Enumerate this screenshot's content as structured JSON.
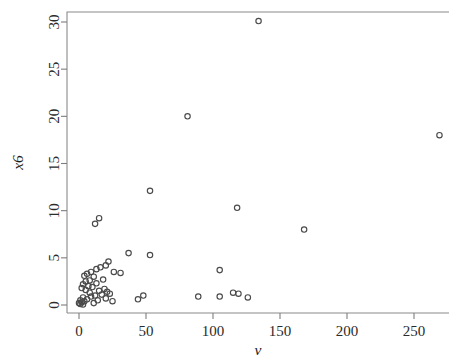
{
  "chart_data": {
    "type": "scatter",
    "title": "",
    "xlabel": "v",
    "ylabel": "x6",
    "xlim": [
      -8,
      278
    ],
    "ylim": [
      -1.2,
      31.5
    ],
    "xticks": [
      0,
      50,
      100,
      150,
      200,
      250
    ],
    "yticks": [
      0,
      5,
      10,
      15,
      20,
      25,
      30
    ],
    "grid": false,
    "legend": null,
    "marker": "open-circle",
    "marker_color": "#4a4a4a",
    "points": [
      {
        "x": 134,
        "y": 30.1
      },
      {
        "x": 81,
        "y": 20.0
      },
      {
        "x": 269,
        "y": 18.0
      },
      {
        "x": 53,
        "y": 12.1
      },
      {
        "x": 118,
        "y": 10.3
      },
      {
        "x": 168,
        "y": 8.0
      },
      {
        "x": 15,
        "y": 9.2
      },
      {
        "x": 12,
        "y": 8.6
      },
      {
        "x": 37,
        "y": 5.5
      },
      {
        "x": 53,
        "y": 5.3
      },
      {
        "x": 105,
        "y": 3.7
      },
      {
        "x": 22,
        "y": 4.6
      },
      {
        "x": 20,
        "y": 4.2
      },
      {
        "x": 16,
        "y": 4.0
      },
      {
        "x": 13,
        "y": 3.8
      },
      {
        "x": 26,
        "y": 3.5
      },
      {
        "x": 31,
        "y": 3.4
      },
      {
        "x": 9,
        "y": 3.5
      },
      {
        "x": 6,
        "y": 3.3
      },
      {
        "x": 11,
        "y": 3.0
      },
      {
        "x": 4,
        "y": 3.1
      },
      {
        "x": 18,
        "y": 2.7
      },
      {
        "x": 8,
        "y": 2.6
      },
      {
        "x": 5,
        "y": 2.5
      },
      {
        "x": 13,
        "y": 2.3
      },
      {
        "x": 3,
        "y": 2.2
      },
      {
        "x": 7,
        "y": 2.0
      },
      {
        "x": 10,
        "y": 1.9
      },
      {
        "x": 2,
        "y": 1.8
      },
      {
        "x": 5,
        "y": 1.6
      },
      {
        "x": 15,
        "y": 1.5
      },
      {
        "x": 19,
        "y": 1.7
      },
      {
        "x": 21,
        "y": 1.4
      },
      {
        "x": 23,
        "y": 1.2
      },
      {
        "x": 17,
        "y": 1.1
      },
      {
        "x": 12,
        "y": 1.0
      },
      {
        "x": 9,
        "y": 0.9
      },
      {
        "x": 3,
        "y": 0.8
      },
      {
        "x": 6,
        "y": 0.6
      },
      {
        "x": 1,
        "y": 0.5
      },
      {
        "x": 4,
        "y": 0.4
      },
      {
        "x": 2,
        "y": 0.3
      },
      {
        "x": 0,
        "y": 0.2
      },
      {
        "x": 1,
        "y": 0.1
      },
      {
        "x": 3,
        "y": 0.05
      },
      {
        "x": 14,
        "y": 0.5
      },
      {
        "x": 20,
        "y": 0.7
      },
      {
        "x": 25,
        "y": 0.4
      },
      {
        "x": 8,
        "y": 1.3
      },
      {
        "x": 11,
        "y": 0.2
      },
      {
        "x": 44,
        "y": 0.6
      },
      {
        "x": 48,
        "y": 1.0
      },
      {
        "x": 89,
        "y": 0.9
      },
      {
        "x": 105,
        "y": 0.9
      },
      {
        "x": 115,
        "y": 1.3
      },
      {
        "x": 119,
        "y": 1.2
      },
      {
        "x": 126,
        "y": 0.8
      }
    ]
  },
  "axes": {
    "x_tick_labels": [
      "0",
      "50",
      "100",
      "150",
      "200",
      "250"
    ],
    "y_tick_labels": [
      "0",
      "5",
      "10",
      "15",
      "20",
      "25",
      "30"
    ],
    "x_axis_title": "v",
    "y_axis_title": "x6"
  }
}
